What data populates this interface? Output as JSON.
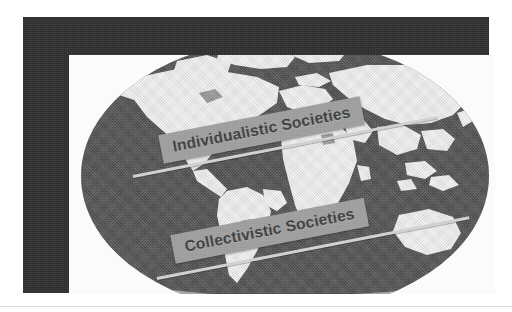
{
  "figure": {
    "frame_color": "#2b2b2b",
    "plate_color": "#fbfbfb",
    "globe_ocean_color": "#4c4c4c",
    "globe_land_color": "#f2f2f2",
    "banner_color": "#9b9b9b",
    "banner_text_color": "#3a3a3a",
    "arrow_color": "#cfcfcf"
  },
  "labels": {
    "individualistic": "Individualistic Societies",
    "collectivistic": "Collectivistic Societies"
  },
  "arrows": [
    {
      "name": "individualistic-axis",
      "angle_deg": -11
    },
    {
      "name": "collectivistic-axis",
      "angle_deg": -11
    }
  ]
}
